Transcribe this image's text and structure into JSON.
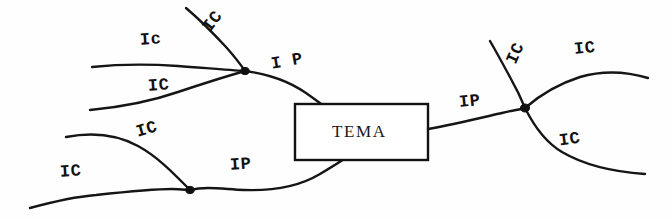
{
  "figure": {
    "type": "hand-drawn-diagram",
    "background_color": "#fefefe",
    "ink_color": "#151515",
    "width": 672,
    "height": 220
  },
  "central_box": {
    "label": "TEMA",
    "x": 295,
    "y": 104,
    "width": 133,
    "height": 56
  },
  "nodes": [
    {
      "name": "upper-left-junction",
      "x": 245,
      "y": 71
    },
    {
      "name": "lower-left-junction",
      "x": 190,
      "y": 190
    },
    {
      "name": "right-junction",
      "x": 525,
      "y": 108
    }
  ],
  "labels": [
    {
      "id": "ic-top-left-upper",
      "text": "Ic",
      "x": 140,
      "y": 30,
      "rotate": -4
    },
    {
      "id": "ic-top-diagonal",
      "text": "IC",
      "x": 202,
      "y": 12,
      "rotate": -52
    },
    {
      "id": "ip-upper-left",
      "text": "I P",
      "x": 271,
      "y": 52,
      "rotate": -10
    },
    {
      "id": "ic-upper-left-lower",
      "text": "IC",
      "x": 148,
      "y": 76,
      "rotate": -4
    },
    {
      "id": "ic-mid-left",
      "text": "IC",
      "x": 136,
      "y": 120,
      "rotate": -16
    },
    {
      "id": "ic-bottom-left",
      "text": "IC",
      "x": 60,
      "y": 162,
      "rotate": -4
    },
    {
      "id": "ip-lower-left",
      "text": "IP",
      "x": 230,
      "y": 155,
      "rotate": -4
    },
    {
      "id": "ip-right",
      "text": "IP",
      "x": 459,
      "y": 92,
      "rotate": -6
    },
    {
      "id": "ic-right-upper-diagonal",
      "text": "IC",
      "x": 505,
      "y": 44,
      "rotate": -66
    },
    {
      "id": "ic-right-top",
      "text": "IC",
      "x": 574,
      "y": 39,
      "rotate": -6
    },
    {
      "id": "ic-right-bottom",
      "text": "IC",
      "x": 559,
      "y": 130,
      "rotate": -8
    }
  ],
  "curves": [
    {
      "id": "ic-top-left-upper-curve",
      "from": "left-edge",
      "to": "upper-left-junction"
    },
    {
      "id": "ic-top-diagonal-curve",
      "from": "top-edge",
      "to": "upper-left-junction"
    },
    {
      "id": "ic-upper-left-lower-curve",
      "from": "left-edge",
      "to": "upper-left-junction"
    },
    {
      "id": "ip-upper-left-curve",
      "from": "upper-left-junction",
      "to": "central-box-top"
    },
    {
      "id": "ic-mid-left-curve",
      "from": "left-edge",
      "to": "lower-left-junction"
    },
    {
      "id": "ic-bottom-left-curve",
      "from": "left-edge",
      "to": "lower-left-junction"
    },
    {
      "id": "ip-lower-left-curve",
      "from": "lower-left-junction",
      "to": "central-box-bottom"
    },
    {
      "id": "ip-right-curve",
      "from": "central-box-right",
      "to": "right-junction"
    },
    {
      "id": "ic-right-upper-diagonal-curve",
      "from": "right-junction",
      "to": "top-edge"
    },
    {
      "id": "ic-right-top-curve",
      "from": "right-junction",
      "to": "right-edge"
    },
    {
      "id": "ic-right-bottom-curve",
      "from": "right-junction",
      "to": "right-edge"
    }
  ]
}
